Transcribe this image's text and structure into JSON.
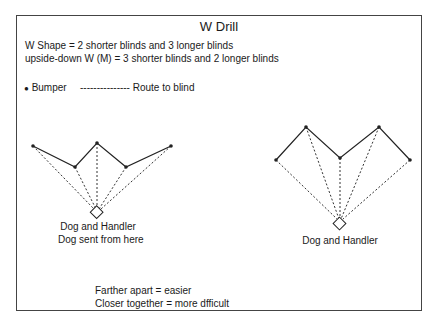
{
  "title": "W Drill",
  "description": [
    "W Shape = 2 shorter blinds and 3 longer blinds",
    "upside-down W (M) = 3 shorter blinds and 2 longer blinds"
  ],
  "legend": {
    "bumper": "Bumper",
    "route": "Route to blind",
    "route_dashes": "---------------"
  },
  "left_diagram": {
    "shape": "W",
    "label_line1": "Dog and Handler",
    "label_line2": "Dog sent from here"
  },
  "right_diagram": {
    "shape": "M",
    "label": "Dog and Handler"
  },
  "notes": [
    "Farther apart = easier",
    "Closer together = more dfficult"
  ]
}
